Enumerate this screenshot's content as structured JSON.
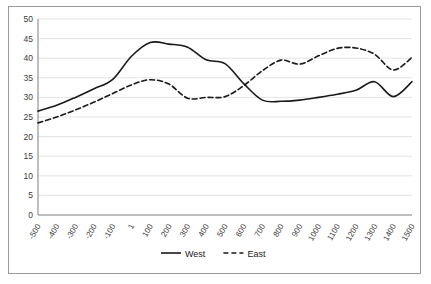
{
  "chart_data": {
    "type": "line",
    "title": "",
    "xlabel": "",
    "ylabel": "",
    "xlim": [
      -500,
      1500
    ],
    "ylim": [
      0,
      50
    ],
    "grid": true,
    "legend_position": "bottom",
    "x": [
      -500,
      -400,
      -300,
      -200,
      -100,
      1,
      100,
      200,
      300,
      400,
      500,
      600,
      700,
      800,
      900,
      1000,
      1100,
      1200,
      1300,
      1400,
      1500
    ],
    "xtick_labels": [
      "-500",
      "-400",
      "-300",
      "-200",
      "-100",
      "1",
      "100",
      "200",
      "300",
      "400",
      "500",
      "600",
      "700",
      "800",
      "900",
      "1000",
      "1100",
      "1200",
      "1300",
      "1400",
      "1500"
    ],
    "ytick_labels": [
      "0",
      "5",
      "10",
      "15",
      "20",
      "25",
      "30",
      "35",
      "40",
      "45",
      "50"
    ],
    "ytick_values": [
      0,
      5,
      10,
      15,
      20,
      25,
      30,
      35,
      40,
      45,
      50
    ],
    "series": [
      {
        "name": "West",
        "style": "solid",
        "color": "#1a1a1a",
        "values": [
          26.5,
          28.0,
          30.0,
          32.2,
          34.6,
          40.5,
          44.0,
          43.6,
          42.8,
          39.6,
          38.6,
          33.5,
          29.3,
          29.0,
          29.3,
          30.0,
          30.8,
          31.8,
          34.0,
          30.2,
          34.0
        ]
      },
      {
        "name": "East",
        "style": "dashed",
        "color": "#1a1a1a",
        "values": [
          23.5,
          25.0,
          26.8,
          28.8,
          31.0,
          33.2,
          34.5,
          33.4,
          29.8,
          30.0,
          30.2,
          33.0,
          36.8,
          39.5,
          38.5,
          40.6,
          42.5,
          42.6,
          41.0,
          37.0,
          40.2
        ]
      }
    ],
    "legend": [
      {
        "label": "West",
        "style": "solid"
      },
      {
        "label": "East",
        "style": "dashed"
      }
    ]
  }
}
